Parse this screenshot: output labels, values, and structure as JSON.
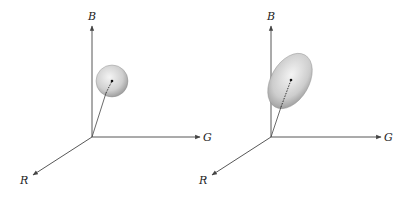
{
  "diagrams": [
    {
      "name": "spherical-distribution",
      "axes": {
        "b_label": "B",
        "g_label": "G",
        "r_label": "R"
      },
      "shape": "sphere"
    },
    {
      "name": "ellipsoidal-distribution",
      "axes": {
        "b_label": "B",
        "g_label": "G",
        "r_label": "R"
      },
      "shape": "ellipsoid"
    }
  ],
  "colors": {
    "axis": "#444444",
    "shape_light": "#f2f2f2",
    "shape_dark": "#9a9a9a",
    "label": "#222222"
  }
}
